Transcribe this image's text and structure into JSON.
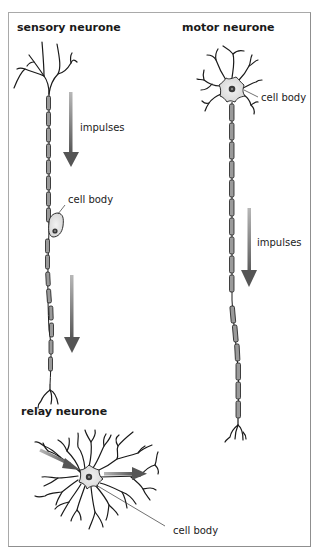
{
  "diagram": {
    "type": "neurone types",
    "neurones": [
      {
        "id": "sensory",
        "title": "sensory neurone",
        "labels": {
          "impulses": "impulses",
          "cell_body": "cell body"
        },
        "arrows": 2,
        "impulse_direction": "down"
      },
      {
        "id": "motor",
        "title": "motor neurone",
        "labels": {
          "impulses": "impulses",
          "cell_body": "cell body"
        },
        "arrows": 1,
        "impulse_direction": "down"
      },
      {
        "id": "relay",
        "title": "relay neurone",
        "labels": {
          "cell_body": "cell body"
        },
        "arrows": 2,
        "impulse_direction": "left-to-right through cell body"
      }
    ],
    "colors": {
      "frame": "#a9a9a9",
      "arrow_dark": "#5a5a5a",
      "arrow_light": "#b0b0b0",
      "myelin": "#9a9a9a",
      "cell_body_fill": "#e4e4e4",
      "nucleus": "#3a3a3a"
    }
  }
}
